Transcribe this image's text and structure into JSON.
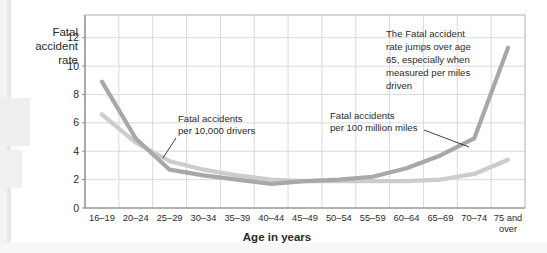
{
  "figure": {
    "background_color": "#ffffff",
    "plot_background_color": "#ffffff",
    "grid_color": "#d6d6d6",
    "border_color": "#bdbdbd"
  },
  "labels": {
    "y_axis_title_line1": "Fatal",
    "y_axis_title_line2": "accident",
    "y_axis_title_line3": "rate",
    "x_axis_title": "Age in years"
  },
  "annotations": [
    {
      "name": "callout-drivers",
      "lines": [
        "Fatal accidents",
        "per 10,000 drivers"
      ],
      "leader": true
    },
    {
      "name": "callout-miles",
      "lines": [
        "Fatal accidents",
        "per 100 million miles"
      ],
      "leader": true
    },
    {
      "name": "callout-jump",
      "lines": [
        "The Fatal accident",
        "rate jumps over age",
        "65, especially when",
        "measured per miles",
        "driven"
      ],
      "leader": false
    }
  ],
  "chart_data": {
    "type": "line",
    "title": "",
    "xlabel": "Age in years",
    "ylabel": "Fatal accident rate",
    "ylim": [
      0,
      13.6
    ],
    "yticks": [
      0,
      2,
      4,
      6,
      8,
      10,
      12
    ],
    "grid": true,
    "legend_position": "inline-annotations",
    "categories": [
      "16–19",
      "20–24",
      "25–29",
      "30–34",
      "35–39",
      "40–44",
      "45–49",
      "50–54",
      "55–59",
      "60–64",
      "65–69",
      "70–74",
      "75 and over"
    ],
    "series": [
      {
        "name": "Fatal accidents per 100 million miles",
        "color": "#a8a8a8",
        "values": [
          8.9,
          4.9,
          2.7,
          2.3,
          2.0,
          1.7,
          1.9,
          2.0,
          2.2,
          2.8,
          3.7,
          4.9,
          11.3
        ]
      },
      {
        "name": "Fatal accidents per 10,000 drivers",
        "color": "#cccccc",
        "values": [
          6.6,
          4.6,
          3.3,
          2.7,
          2.3,
          2.0,
          1.9,
          1.9,
          1.9,
          1.9,
          2.0,
          2.4,
          3.4
        ]
      }
    ]
  }
}
